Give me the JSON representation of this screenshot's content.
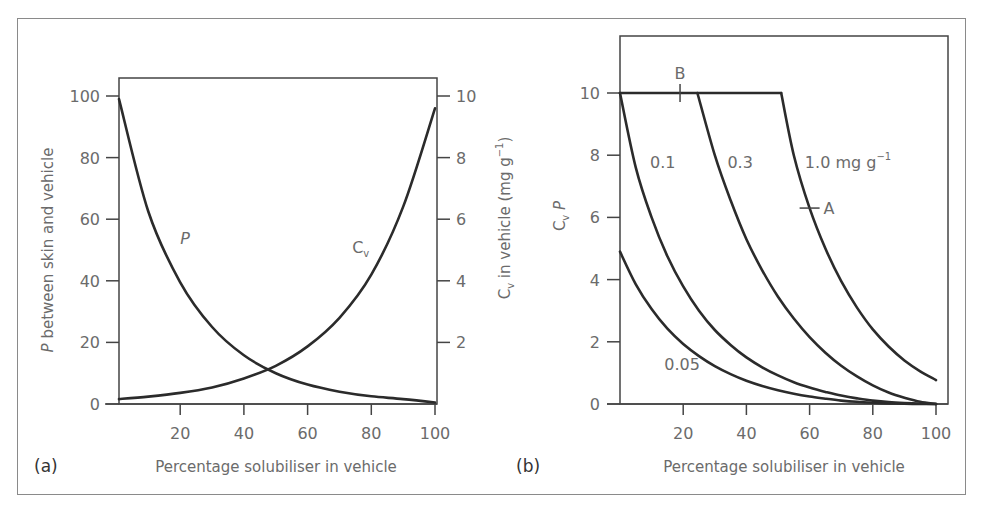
{
  "figure": {
    "panel_a_label": "(a)",
    "panel_b_label": "(b)"
  },
  "colors": {
    "curve": "#2b2b2b",
    "axis": "#444444",
    "text": "#6b6b6b",
    "frame": "#8a8a8a"
  },
  "chart_data": [
    {
      "type": "line",
      "panel": "a",
      "title": "",
      "xlabel": "Percentage solubiliser in vehicle",
      "ylabel": "P between skin and vehicle",
      "y2label": "C_v in vehicle (mg g^-1)",
      "y2label_parts": {
        "sym": "C",
        "sub": "v",
        "rest": " in vehicle (mg g",
        "sup": "−1",
        "close": ")"
      },
      "ylabel_parts": {
        "sym": "P",
        "rest": " between skin and vehicle"
      },
      "xlim": [
        0,
        100
      ],
      "ylim": [
        0,
        100
      ],
      "y2lim": [
        0,
        10
      ],
      "xticks": [
        20,
        40,
        60,
        80,
        100
      ],
      "yticks": [
        0,
        20,
        40,
        60,
        80,
        100
      ],
      "y2ticks": [
        2,
        4,
        6,
        8,
        10
      ],
      "grid": false,
      "x": [
        0,
        10,
        20,
        30,
        40,
        50,
        60,
        70,
        80,
        90,
        100
      ],
      "series": [
        {
          "name": "P",
          "axis": "left",
          "values": [
            99,
            62.5,
            39.5,
            25,
            15.8,
            10,
            6.3,
            4.0,
            2.5,
            1.6,
            0.5
          ],
          "label": "P",
          "label_pos": [
            20,
            52
          ]
        },
        {
          "name": "C_v",
          "axis": "right",
          "values": [
            0.16,
            0.24,
            0.36,
            0.54,
            0.83,
            1.24,
            1.87,
            2.8,
            4.2,
            6.4,
            9.6
          ],
          "label": "C",
          "label_sub": "v",
          "label_pos": [
            74,
            4.9
          ]
        }
      ]
    },
    {
      "type": "line",
      "panel": "b",
      "title": "",
      "xlabel": "Percentage solubiliser in vehicle",
      "ylabel": "C_v P",
      "ylabel_parts": {
        "sym": "C",
        "sub": "v",
        "rest": " P"
      },
      "xlim": [
        0,
        100
      ],
      "ylim": [
        0,
        12
      ],
      "xticks": [
        20,
        40,
        60,
        80,
        100
      ],
      "yticks": [
        0,
        2,
        4,
        6,
        8,
        10
      ],
      "grid": false,
      "x": [
        0,
        5,
        10,
        15,
        20,
        25,
        30,
        35,
        40,
        45,
        50,
        55,
        60,
        65,
        70,
        75,
        80,
        85,
        90,
        95,
        100
      ],
      "series": [
        {
          "name": "0.05",
          "label": "0.05",
          "label_pos": [
            14,
            1.1
          ],
          "values": [
            4.9,
            3.85,
            3.05,
            2.42,
            1.93,
            1.54,
            1.22,
            0.96,
            0.75,
            0.58,
            0.44,
            0.33,
            0.24,
            0.17,
            0.11,
            0.07,
            0.04,
            0.02,
            0.01,
            0.0,
            0.0
          ]
        },
        {
          "name": "0.1",
          "label": "0.1",
          "label_pos": [
            9.5,
            7.6
          ],
          "values": [
            10,
            7.6,
            6.0,
            4.75,
            3.78,
            3.0,
            2.38,
            1.9,
            1.5,
            1.18,
            0.92,
            0.7,
            0.53,
            0.39,
            0.27,
            0.18,
            0.11,
            0.06,
            0.03,
            0.01,
            0.0
          ]
        },
        {
          "name": "0.3",
          "label": "0.3",
          "label_pos": [
            34,
            7.6
          ],
          "flat_until": 24.5,
          "values": [
            10,
            10,
            10,
            10,
            10,
            10,
            8.0,
            6.55,
            5.3,
            4.3,
            3.45,
            2.75,
            2.15,
            1.65,
            1.23,
            0.89,
            0.6,
            0.37,
            0.2,
            0.07,
            0.0
          ]
        },
        {
          "name": "1.0 mg g^-1",
          "label": "1.0 mg g",
          "label_sup": "−1",
          "label_pos": [
            58.5,
            7.6
          ],
          "flat_until": 51,
          "values": [
            10,
            10,
            10,
            10,
            10,
            10,
            10,
            10,
            10,
            10,
            10,
            8.0,
            6.3,
            5.0,
            3.95,
            3.1,
            2.4,
            1.85,
            1.4,
            1.05,
            0.77
          ]
        }
      ],
      "annotations": [
        {
          "text": "B",
          "x": 19,
          "y": 10,
          "mark": "vertical"
        },
        {
          "text": "A",
          "x": 60,
          "y": 6.3,
          "mark": "horizontal"
        }
      ]
    }
  ]
}
